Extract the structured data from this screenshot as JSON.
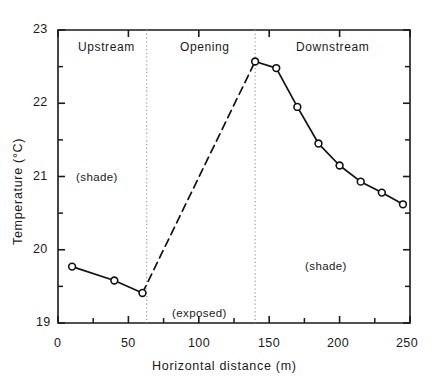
{
  "chart_data": {
    "type": "line",
    "title": "",
    "xlabel": "Horizontal distance (m)",
    "ylabel": "Temperature (°C)",
    "xlim": [
      0,
      250
    ],
    "ylim": [
      19,
      23
    ],
    "grid": false,
    "legend": "none",
    "x_ticks_major": [
      0,
      50,
      100,
      150,
      200,
      250
    ],
    "x_ticks_major_labels": [
      "0",
      "50",
      "100",
      "150",
      "200",
      "250"
    ],
    "x_ticks_minor": [
      25,
      75,
      125,
      175,
      225
    ],
    "y_ticks_major": [
      19,
      20,
      21,
      22,
      23
    ],
    "y_ticks_major_labels": [
      "19",
      "20",
      "21",
      "22",
      "23"
    ],
    "y_ticks_minor": [
      19.5,
      20.5,
      21.5,
      22.5
    ],
    "series": [
      {
        "name": "upstream-shaded-reach",
        "style": "solid",
        "marker": "open-circle",
        "points": [
          {
            "x": 10,
            "y": 19.77
          },
          {
            "x": 40,
            "y": 19.58
          },
          {
            "x": 60,
            "y": 19.41
          }
        ]
      },
      {
        "name": "opening-exposed-reach",
        "style": "dashed",
        "marker": "none",
        "points": [
          {
            "x": 60,
            "y": 19.41
          },
          {
            "x": 140,
            "y": 22.57
          }
        ]
      },
      {
        "name": "downstream-shaded-reach",
        "style": "solid",
        "marker": "open-circle",
        "points": [
          {
            "x": 140,
            "y": 22.57
          },
          {
            "x": 155,
            "y": 22.48
          },
          {
            "x": 170,
            "y": 21.95
          },
          {
            "x": 185,
            "y": 21.45
          },
          {
            "x": 200,
            "y": 21.15
          },
          {
            "x": 215,
            "y": 20.93
          },
          {
            "x": 230,
            "y": 20.78
          },
          {
            "x": 245,
            "y": 20.62
          }
        ]
      }
    ],
    "dividers": [
      {
        "name": "upstream-opening-boundary",
        "x": 63,
        "style": "dotted"
      },
      {
        "name": "opening-downstream-boundary",
        "x": 140,
        "style": "dotted"
      }
    ],
    "annotations": [
      {
        "name": "region-label-upstream",
        "text": "Upstream",
        "x": 30,
        "y": 22.78
      },
      {
        "name": "region-label-opening",
        "text": "Opening",
        "x": 100,
        "y": 22.78
      },
      {
        "name": "region-label-downstream",
        "text": "Downstream",
        "x": 188,
        "y": 22.78
      },
      {
        "name": "annotation-shade-upstream",
        "text": "(shade)",
        "x": 30,
        "y": 21.0
      },
      {
        "name": "annotation-exposed-opening",
        "text": "(exposed)",
        "x": 100,
        "y": 19.2
      },
      {
        "name": "annotation-shade-downstream",
        "text": "(shade)",
        "x": 186,
        "y": 20.1
      }
    ]
  },
  "style": {
    "axis_color": "#1a1a1a",
    "line_color": "#111111",
    "marker_fill": "#ffffff",
    "divider_color": "#9a9a9a",
    "background": "#ffffff"
  }
}
